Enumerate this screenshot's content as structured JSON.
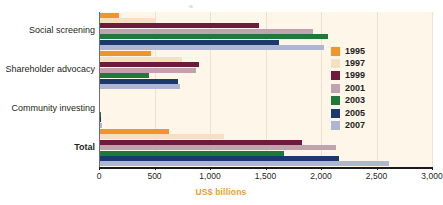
{
  "chart_data": {
    "type": "bar",
    "orientation": "horizontal",
    "title": "",
    "subtitle": "",
    "xlabel": "US$ billions",
    "ylabel": "",
    "xlim": [
      0,
      3000
    ],
    "xticks": [
      0,
      500,
      1000,
      1500,
      2000,
      2500,
      3000
    ],
    "xtick_labels": [
      "0",
      "500",
      "1,000",
      "1,500",
      "2,000",
      "2,500",
      "3,000"
    ],
    "categories": [
      "Social screening",
      "Shareholder advocacy",
      "Community investing",
      "Total"
    ],
    "grid": true,
    "legend_position": "right",
    "series": [
      {
        "name": "1995",
        "color": "#f0952c",
        "values": [
          180,
          470,
          4,
          630
        ]
      },
      {
        "name": "1997",
        "color": "#f6dfc3",
        "values": [
          513,
          745,
          4,
          1125
        ]
      },
      {
        "name": "1999",
        "color": "#6e1a3c",
        "values": [
          1440,
          900,
          5,
          1830
        ]
      },
      {
        "name": "2001",
        "color": "#bfa3ae",
        "values": [
          1930,
          875,
          8,
          2135
        ]
      },
      {
        "name": "2003",
        "color": "#1f7a3a",
        "values": [
          2063,
          450,
          14,
          1665
        ]
      },
      {
        "name": "2005",
        "color": "#1b3a6b",
        "values": [
          1620,
          710,
          20,
          2165
        ]
      },
      {
        "name": "2007",
        "color": "#afb6d4",
        "values": [
          2030,
          730,
          26,
          2615
        ]
      }
    ]
  },
  "axis": {
    "x_title": "US$ billions",
    "x_title_color": "#eb9c36"
  },
  "legend": {
    "items": [
      {
        "label": "1995",
        "color": "#f0952c"
      },
      {
        "label": "1997",
        "color": "#f6dfc3"
      },
      {
        "label": "1999",
        "color": "#6e1a3c"
      },
      {
        "label": "2001",
        "color": "#bfa3ae"
      },
      {
        "label": "2003",
        "color": "#1f7a3a"
      },
      {
        "label": "2005",
        "color": "#1b3a6b"
      },
      {
        "label": "2007",
        "color": "#afb6d4"
      }
    ]
  },
  "categories": [
    {
      "label": "Social screening",
      "bold": false
    },
    {
      "label": "Shareholder advocacy",
      "bold": false
    },
    {
      "label": "Community investing",
      "bold": false
    },
    {
      "label": "Total",
      "bold": true
    }
  ],
  "colors": {
    "plot_background": "#fdf6e9",
    "page_background": "#ffffff",
    "axis": "#1b1b1b",
    "gridline": "#ece2cd",
    "accent": "#eb9c36"
  }
}
